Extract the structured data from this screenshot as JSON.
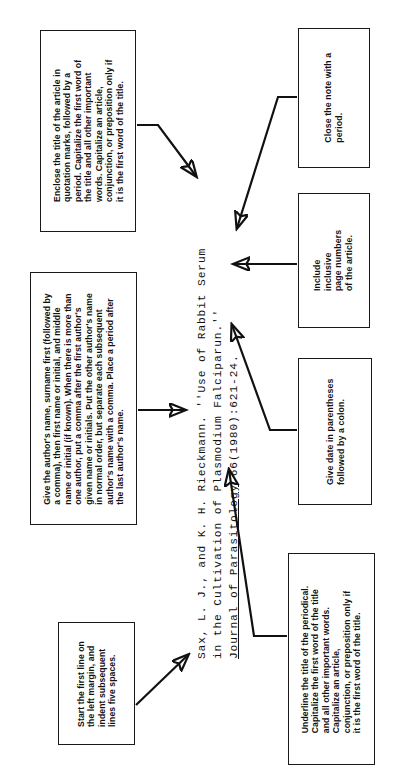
{
  "diagram": {
    "ink_color": "#111111",
    "background_color": "#ffffff"
  },
  "citation": {
    "line1": "Sax, L. J., and K. H. Rieckmann. ''Use of Rabbit Serum",
    "line2": "in the Cultivation of Plasmodium Falciparun.''",
    "line3_underlined": "Journal of Parasitology",
    "line3_rest": " 66(1980):621-24."
  },
  "callouts": {
    "article_title": "Enclose the title of the article in\nquotation marks, followed by a\nperiod. Capitalize the first word of\nthe title and all other important\nwords. Capitalize an article,\nconjunction, or preposition only if\nit is the first word of the title.",
    "author_name": "Give the author's name, surname first (followed by\na comma), then first name or initial, and middle\nname or initial (if known). When there is more than\none author, put a comma after the first author's\ngiven name or initials. Put the other author's name\nin normal order, but separate each subsequent\nauthor's name with a comma. Place a period after\nthe last author's name.",
    "first_line": "Start the first line on\nthe left margin, and\nindent subsequent\nlines five spaces.",
    "close_note": "Close the note with a\nperiod.",
    "page_numbers": "Include\ninclusive\npage numbers\nof the article.",
    "date": "Give date in parentheses\nfollowed by a colon.",
    "periodical": "Underline the title of the periodical.\nCapitalize the first word of the title\nand all other important words.\nCapitalize an article,\nconjunction, or preposition only if\nit is the first word of the title."
  }
}
